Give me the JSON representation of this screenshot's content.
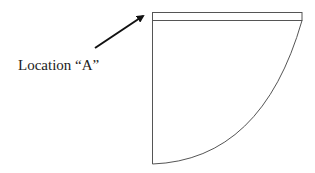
{
  "diagram": {
    "label": "Location “A”",
    "colors": {
      "stroke": "#555555",
      "arrow": "#111111",
      "text": "#222222",
      "background": "#ffffff"
    },
    "shape": "quarter-circle sector with a thin rectangular band along its top edge",
    "arrow_target": "top-left corner of the top band"
  }
}
